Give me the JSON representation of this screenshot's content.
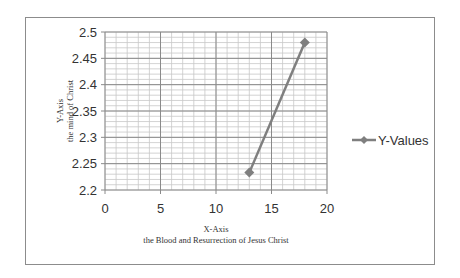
{
  "chart_data": {
    "type": "line",
    "title": "",
    "xlabel": "X-Axis",
    "xlabel_sub": "the Blood and Resurrection of Jesus Christ",
    "ylabel": "Y-Axis",
    "ylabel_sub": "the mind of Christ",
    "xlim": [
      0,
      20
    ],
    "ylim": [
      2.2,
      2.5
    ],
    "x_ticks": [
      "0",
      "5",
      "10",
      "15",
      "20"
    ],
    "y_ticks": [
      "2.2",
      "2.25",
      "2.3",
      "2.35",
      "2.4",
      "2.45",
      "2.5"
    ],
    "grid": {
      "major": true,
      "minor": true,
      "x_minor_step": 1,
      "y_minor_step": 0.01
    },
    "legend_position": "right",
    "series": [
      {
        "name": "Y-Values",
        "color": "#7f7f7f",
        "marker": "diamond",
        "x": [
          13,
          18
        ],
        "values": [
          2.233,
          2.48
        ]
      }
    ]
  }
}
